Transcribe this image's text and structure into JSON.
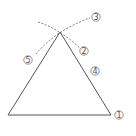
{
  "diagram": {
    "type": "geometric-construction",
    "colors": {
      "stroke": "#555555",
      "background": "#ffffff"
    },
    "triangle": {
      "apex": [
        60,
        32
      ],
      "base_left": [
        8,
        115
      ],
      "base_right": [
        111,
        115
      ]
    },
    "steps": [
      {
        "id": 1,
        "label": "①",
        "position": [
          119,
          115
        ]
      },
      {
        "id": 2,
        "label": "②",
        "position": [
          84,
          51
        ]
      },
      {
        "id": 3,
        "label": "③",
        "position": [
          96,
          17
        ]
      },
      {
        "id": 4,
        "label": "④",
        "position": [
          95,
          71
        ]
      },
      {
        "id": 5,
        "label": "⑤",
        "position": [
          28,
          60
        ]
      }
    ]
  }
}
